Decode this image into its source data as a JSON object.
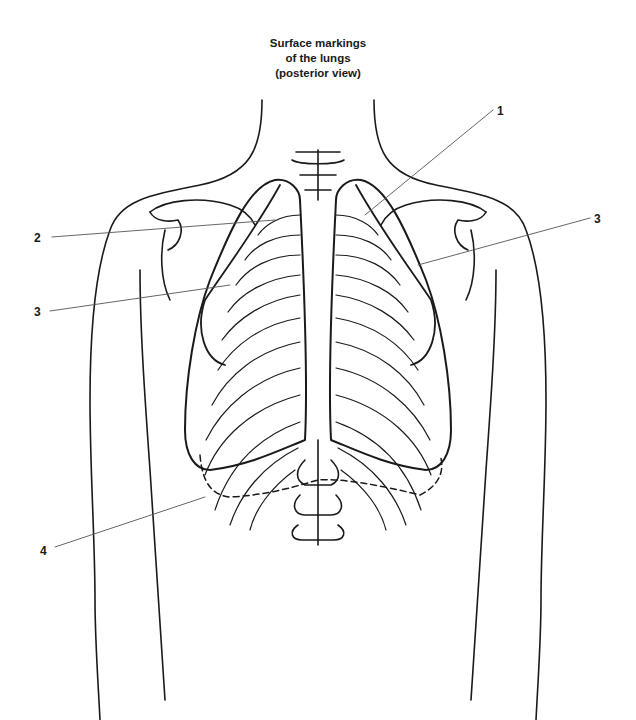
{
  "title": {
    "line1": "Surface markings",
    "line2": "of the lungs",
    "line3": "(posterior view)"
  },
  "labels": [
    {
      "id": "1",
      "text": "1",
      "x": 497,
      "y": 104
    },
    {
      "id": "2",
      "text": "2",
      "x": 34,
      "y": 231
    },
    {
      "id": "3-left",
      "text": "3",
      "x": 34,
      "y": 305
    },
    {
      "id": "3-right",
      "text": "3",
      "x": 594,
      "y": 212
    },
    {
      "id": "4",
      "text": "4",
      "x": 40,
      "y": 544
    }
  ],
  "colors": {
    "ink": "#1a1a1a",
    "leader": "#555555",
    "background": "#ffffff"
  }
}
